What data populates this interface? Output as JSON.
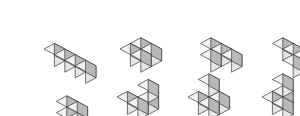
{
  "figure": {
    "title": "",
    "background_color": "#ffffff",
    "canvas": {
      "width": 300,
      "height": 116
    },
    "projection": "isometric",
    "cube": {
      "unit_x": 13,
      "unit_y": 7,
      "unit_z": 15,
      "colors": {
        "top": "#f2f2f2",
        "left": "#e6e6e6",
        "right": "#b8b8b8",
        "edge": "#3a3a3a"
      }
    },
    "rows": 2,
    "columns": 4,
    "shapes": [
      {
        "id": "shape-1",
        "label": "straight-row-of-four",
        "position": {
          "row": 1,
          "col": 1
        },
        "origin": {
          "x": 12,
          "y": 14
        },
        "cube_count": 4,
        "cubes": [
          {
            "x": 0,
            "y": 0,
            "z": 0
          },
          {
            "x": 1,
            "y": 0,
            "z": 0
          },
          {
            "x": 2,
            "y": 0,
            "z": 0
          },
          {
            "x": 3,
            "y": 0,
            "z": 0
          }
        ]
      },
      {
        "id": "shape-2",
        "label": "square-two-by-two",
        "position": {
          "row": 1,
          "col": 2
        },
        "origin": {
          "x": 88,
          "y": 14
        },
        "cube_count": 4,
        "cubes": [
          {
            "x": 0,
            "y": 0,
            "z": 0
          },
          {
            "x": 1,
            "y": 0,
            "z": 0
          },
          {
            "x": 0,
            "y": 1,
            "z": 0
          },
          {
            "x": 1,
            "y": 1,
            "z": 0
          }
        ]
      },
      {
        "id": "shape-3",
        "label": "tee-flat",
        "position": {
          "row": 1,
          "col": 3
        },
        "origin": {
          "x": 158,
          "y": 14
        },
        "cube_count": 4,
        "cubes": [
          {
            "x": 0,
            "y": 1,
            "z": 0
          },
          {
            "x": 1,
            "y": 1,
            "z": 0
          },
          {
            "x": 2,
            "y": 1,
            "z": 0
          },
          {
            "x": 1,
            "y": 0,
            "z": 0
          }
        ]
      },
      {
        "id": "shape-4",
        "label": "ell-flat",
        "position": {
          "row": 1,
          "col": 4
        },
        "origin": {
          "x": 230,
          "y": 14
        },
        "cube_count": 4,
        "cubes": [
          {
            "x": 0,
            "y": 1,
            "z": 0
          },
          {
            "x": 1,
            "y": 1,
            "z": 0
          },
          {
            "x": 2,
            "y": 1,
            "z": 0
          },
          {
            "x": 2,
            "y": 0,
            "z": 0
          }
        ]
      },
      {
        "id": "shape-5",
        "label": "ess-flat-offset-pairs",
        "position": {
          "row": 2,
          "col": 1
        },
        "origin": {
          "x": 14,
          "y": 72
        },
        "cube_count": 4,
        "cubes": [
          {
            "x": 0,
            "y": 1,
            "z": 0
          },
          {
            "x": 1,
            "y": 1,
            "z": 0
          },
          {
            "x": 1,
            "y": 0,
            "z": 0
          },
          {
            "x": 2,
            "y": 0,
            "z": 0
          }
        ]
      },
      {
        "id": "shape-6",
        "label": "ell-with-stacked-cube",
        "position": {
          "row": 2,
          "col": 2
        },
        "origin": {
          "x": 85,
          "y": 62
        },
        "cube_count": 4,
        "cubes": [
          {
            "x": 0,
            "y": 0,
            "z": 0
          },
          {
            "x": 1,
            "y": 0,
            "z": 0
          },
          {
            "x": 1,
            "y": 1,
            "z": 0
          },
          {
            "x": 1,
            "y": 1,
            "z": 1
          }
        ]
      },
      {
        "id": "shape-7",
        "label": "tripod-corner",
        "position": {
          "row": 2,
          "col": 3
        },
        "origin": {
          "x": 156,
          "y": 62
        },
        "cube_count": 4,
        "cubes": [
          {
            "x": 0,
            "y": 0,
            "z": 0
          },
          {
            "x": 1,
            "y": 0,
            "z": 0
          },
          {
            "x": 1,
            "y": 1,
            "z": 0
          },
          {
            "x": 0,
            "y": 1,
            "z": 1
          }
        ]
      },
      {
        "id": "shape-8",
        "label": "tower-with-side-cube",
        "position": {
          "row": 2,
          "col": 4
        },
        "origin": {
          "x": 230,
          "y": 62
        },
        "cube_count": 4,
        "cubes": [
          {
            "x": 0,
            "y": 0,
            "z": 0
          },
          {
            "x": 1,
            "y": 0,
            "z": 0
          },
          {
            "x": 0,
            "y": 1,
            "z": 0
          },
          {
            "x": 0,
            "y": 1,
            "z": 1
          }
        ]
      }
    ]
  }
}
